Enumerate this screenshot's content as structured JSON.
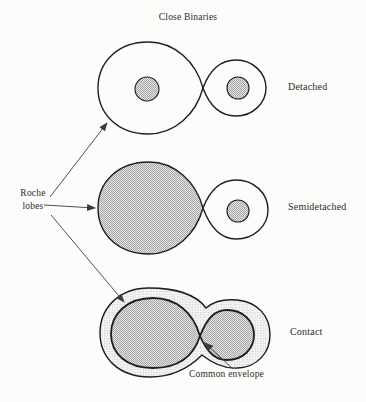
{
  "title": "Close Binaries",
  "pointer_label": {
    "line1": "Roche",
    "line2": "lobes"
  },
  "configurations": [
    {
      "label": "Detached"
    },
    {
      "label": "Semidetached"
    },
    {
      "label": "Contact"
    }
  ],
  "annotations": {
    "common_envelope": "Common envelope"
  },
  "colors": {
    "background": "#fcfcfb",
    "line": "#1e1e1e",
    "text": "#2b2b2b",
    "arrow": "#3c3c3c",
    "star_bg": "#e2e2e2",
    "star_dot": "#a9a9a9",
    "envelope_bg": "#f3f3f1",
    "envelope_dot": "#c7c7c7"
  }
}
